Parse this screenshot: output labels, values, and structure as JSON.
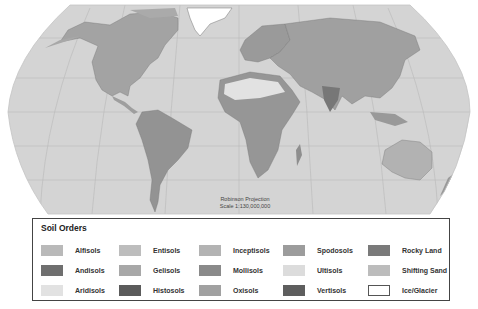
{
  "map": {
    "projection_label": "Robinson Projection",
    "scale_label": "Scale 1:130,000,000",
    "ocean_color": "#d4d4d4",
    "graticule_color": "#b8b8b8",
    "land_color": "#9a9a9a"
  },
  "legend": {
    "title": "Soil Orders",
    "items": [
      {
        "label": "Alfisols",
        "color": "#b9b9b9",
        "col": 0,
        "row": 0
      },
      {
        "label": "Andisols",
        "color": "#6f6f6f",
        "col": 0,
        "row": 1
      },
      {
        "label": "Aridisols",
        "color": "#e2e2e2",
        "col": 0,
        "row": 2
      },
      {
        "label": "Entisols",
        "color": "#bdbdbd",
        "col": 1,
        "row": 0
      },
      {
        "label": "Gelisols",
        "color": "#a8a8a8",
        "col": 1,
        "row": 1
      },
      {
        "label": "Histosols",
        "color": "#5b5b5b",
        "col": 1,
        "row": 2
      },
      {
        "label": "Inceptisols",
        "color": "#b3b3b3",
        "col": 2,
        "row": 0
      },
      {
        "label": "Mollisols",
        "color": "#8a8a8a",
        "col": 2,
        "row": 1
      },
      {
        "label": "Oxisols",
        "color": "#a1a1a1",
        "col": 2,
        "row": 2
      },
      {
        "label": "Spodosols",
        "color": "#9c9c9c",
        "col": 3,
        "row": 0
      },
      {
        "label": "Ultisols",
        "color": "#dcdcdc",
        "col": 3,
        "row": 1
      },
      {
        "label": "Vertisols",
        "color": "#5e5e5e",
        "col": 3,
        "row": 2
      },
      {
        "label": "Rocky Land",
        "color": "#7a7a7a",
        "col": 4,
        "row": 0
      },
      {
        "label": "Shifting Sand",
        "color": "#bcbcbc",
        "col": 4,
        "row": 1
      },
      {
        "label": "Ice/Glacier",
        "color": "#ffffff",
        "col": 4,
        "row": 2
      }
    ]
  }
}
